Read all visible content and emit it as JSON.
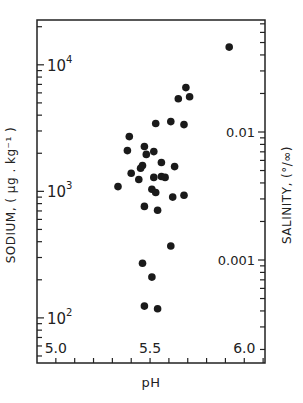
{
  "chart_data": {
    "type": "scatter",
    "title": "",
    "xlabel": "pH",
    "ylabel": "SODIUM, ( µg . kg⁻¹ )",
    "ylabel_right": "SALINITY, (°/∞)",
    "x_ticks": [
      5.0,
      5.5,
      6.0
    ],
    "x_tick_labels": [
      "5.0",
      "5.5",
      "6.0"
    ],
    "x_minor_step": 0.1,
    "xlim": [
      4.9,
      6.11
    ],
    "yscale": "log",
    "ylim": [
      44,
      22600
    ],
    "y_ticks": [
      100,
      1000,
      10000
    ],
    "y_tick_labels": [
      "10",
      "10",
      "10"
    ],
    "y_tick_exponents": [
      "2",
      "3",
      "4"
    ],
    "y_right_ticks": [
      0.001,
      0.01
    ],
    "y_right_tick_labels": [
      "0.001",
      "0.01"
    ],
    "y_right_pixel_ref": {
      "0.01": 132,
      "0.001": 260
    },
    "grid": false,
    "legend": null,
    "marker_color": "#1a1a1a",
    "points": [
      {
        "x": 5.92,
        "y": 13800
      },
      {
        "x": 5.69,
        "y": 6600
      },
      {
        "x": 5.65,
        "y": 5400
      },
      {
        "x": 5.71,
        "y": 5600
      },
      {
        "x": 5.53,
        "y": 3440
      },
      {
        "x": 5.61,
        "y": 3560
      },
      {
        "x": 5.68,
        "y": 3370
      },
      {
        "x": 5.39,
        "y": 2710
      },
      {
        "x": 5.38,
        "y": 2100
      },
      {
        "x": 5.47,
        "y": 2260
      },
      {
        "x": 5.48,
        "y": 1960
      },
      {
        "x": 5.52,
        "y": 2060
      },
      {
        "x": 5.56,
        "y": 1690
      },
      {
        "x": 5.63,
        "y": 1570
      },
      {
        "x": 5.46,
        "y": 1600
      },
      {
        "x": 5.45,
        "y": 1520
      },
      {
        "x": 5.4,
        "y": 1390
      },
      {
        "x": 5.44,
        "y": 1240
      },
      {
        "x": 5.52,
        "y": 1290
      },
      {
        "x": 5.56,
        "y": 1310
      },
      {
        "x": 5.58,
        "y": 1290
      },
      {
        "x": 5.33,
        "y": 1090
      },
      {
        "x": 5.51,
        "y": 1040
      },
      {
        "x": 5.53,
        "y": 980
      },
      {
        "x": 5.62,
        "y": 900
      },
      {
        "x": 5.68,
        "y": 930
      },
      {
        "x": 5.47,
        "y": 760
      },
      {
        "x": 5.54,
        "y": 710
      },
      {
        "x": 5.61,
        "y": 370
      },
      {
        "x": 5.46,
        "y": 270
      },
      {
        "x": 5.51,
        "y": 210
      },
      {
        "x": 5.47,
        "y": 124
      },
      {
        "x": 5.54,
        "y": 118
      }
    ]
  }
}
